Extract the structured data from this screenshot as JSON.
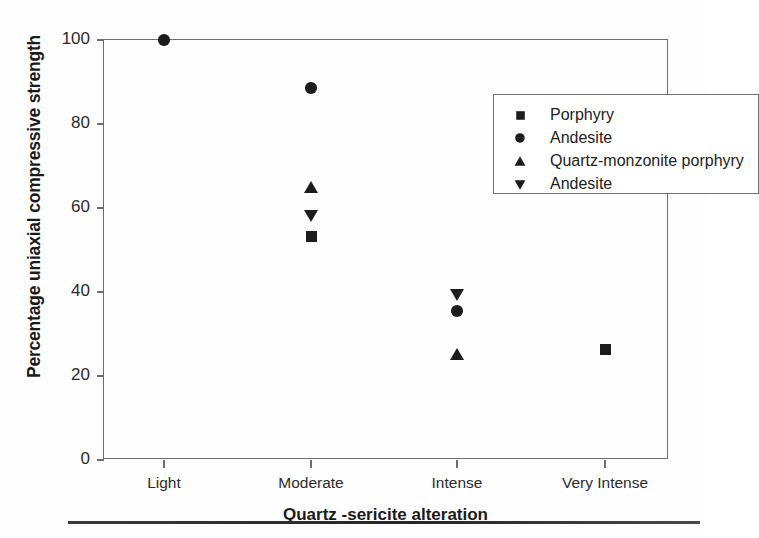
{
  "chart_data": {
    "type": "scatter",
    "title": "",
    "xlabel": "Quartz -sericite alteration",
    "ylabel": "Percentage uniaxial compressive strength",
    "categories": [
      "Light",
      "Moderate",
      "Intense",
      "Very Intense"
    ],
    "ylim": [
      0,
      100
    ],
    "yticks": [
      0,
      20,
      40,
      60,
      80,
      100
    ],
    "grid": false,
    "legend_position": "top-right",
    "series": [
      {
        "name": "Porphyry",
        "marker": "square",
        "color": "#1c1c1c",
        "points": [
          {
            "x": "Moderate",
            "y": 53.3
          },
          {
            "x": "Very Intense",
            "y": 26.4
          }
        ]
      },
      {
        "name": "Andesite",
        "marker": "circle",
        "color": "#1c1c1c",
        "points": [
          {
            "x": "Light",
            "y": 100.0
          },
          {
            "x": "Moderate",
            "y": 88.6
          },
          {
            "x": "Intense",
            "y": 35.5
          }
        ]
      },
      {
        "name": "Quartz-monzonite porphyry",
        "marker": "triangle-up",
        "color": "#1c1c1c",
        "points": [
          {
            "x": "Moderate",
            "y": 64.8
          },
          {
            "x": "Intense",
            "y": 25.1
          }
        ]
      },
      {
        "name": "Andesite",
        "marker": "triangle-down",
        "color": "#1c1c1c",
        "points": [
          {
            "x": "Moderate",
            "y": 58.2
          },
          {
            "x": "Intense",
            "y": 39.3
          }
        ]
      }
    ]
  },
  "axes": {
    "y_title": "Percentage uniaxial compressive strength",
    "x_title": "Quartz -sericite alteration",
    "y_tick_labels": [
      "0",
      "20",
      "40",
      "60",
      "80",
      "100"
    ],
    "x_tick_labels": [
      "Light",
      "Moderate",
      "Intense",
      "Very Intense"
    ]
  },
  "legend": {
    "entries": [
      {
        "label": "Porphyry",
        "marker": "square-icon"
      },
      {
        "label": "Andesite",
        "marker": "circle-icon"
      },
      {
        "label": "Quartz-monzonite porphyry",
        "marker": "triangle-up-icon"
      },
      {
        "label": "Andesite",
        "marker": "triangle-down-icon"
      }
    ]
  },
  "colors": {
    "marker": "#1c1c1c",
    "axis": "#6e6e6e",
    "text": "#1a1a1a",
    "background": "#ffffff"
  }
}
